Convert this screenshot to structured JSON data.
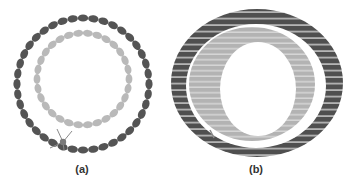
{
  "figure": {
    "panels": [
      {
        "id": "a",
        "label": "(a)",
        "description": "Concentric rings of beads: outer dark ring and inner light ring with a small tether",
        "outer_ring": {
          "cx": 83,
          "cy": 84,
          "r": 66,
          "bead_count": 40,
          "color": "#545454"
        },
        "inner_ring": {
          "cx": 83,
          "cy": 79,
          "r": 46,
          "bead_count": 30,
          "color": "#b9b9b9"
        },
        "tether": {
          "x": 63,
          "y": 142,
          "color": "#7a7a7a"
        },
        "label_pos": {
          "x": 82,
          "y": 165
        }
      },
      {
        "id": "b",
        "label": "(b)",
        "description": "Tilted view of concentric tubes: thick dark outer band and light inner band",
        "outer_band": {
          "cx": 257,
          "cy": 83,
          "rx": 86,
          "ry": 74,
          "color": "#4f4f4f"
        },
        "gap": {
          "cx": 256,
          "cy": 85,
          "rx": 70,
          "ry": 62
        },
        "inner_band": {
          "cx": 252,
          "cy": 84,
          "rx": 63,
          "ry": 57,
          "color": "#b3b3b3"
        },
        "hole": {
          "cx": 258,
          "cy": 89,
          "rx": 38,
          "ry": 47
        },
        "label_pos": {
          "x": 256,
          "y": 165
        }
      }
    ],
    "colors": {
      "dark": "#545454",
      "light": "#b9b9b9",
      "stripe": "#e6e6e6",
      "label": "#333333"
    }
  }
}
